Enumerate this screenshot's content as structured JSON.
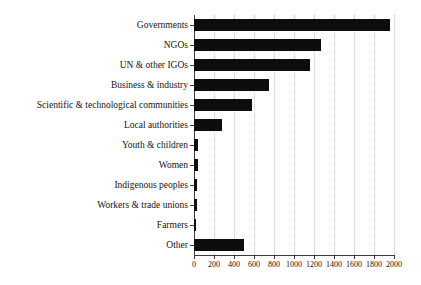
{
  "chart_data": {
    "type": "bar",
    "orientation": "horizontal",
    "title": "",
    "subtitle": "",
    "xlabel": "",
    "ylabel": "",
    "xlim": [
      0,
      2000
    ],
    "grid": true,
    "grid_axis": "x",
    "legend": false,
    "legend_position": "none",
    "xticks": [
      0,
      200,
      400,
      600,
      800,
      1000,
      1200,
      1400,
      1600,
      1800,
      2000
    ],
    "xtick_labels": [
      "0",
      "200",
      "400",
      "600",
      "800",
      "1000",
      "1200",
      "1400",
      "1600",
      "1800",
      "2000"
    ],
    "categories": [
      "Governments",
      "NGOs",
      "UN & other IGOs",
      "Business & industry",
      "Scientific & technological communities",
      "Local authorities",
      "Youth & children",
      "Women",
      "Indigenous peoples",
      "Workers & trade unions",
      "Farmers",
      "Other"
    ],
    "values": [
      1960,
      1270,
      1160,
      745,
      575,
      280,
      40,
      35,
      30,
      30,
      15,
      500
    ],
    "bar_color": "#0d0d0d",
    "grid_color": "#c9c9c9",
    "axis_color": "#3a3a3a"
  }
}
